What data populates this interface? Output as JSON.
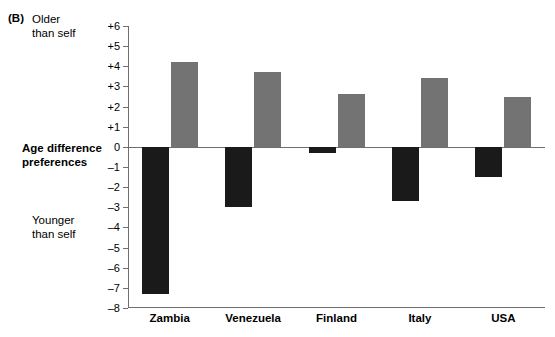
{
  "panel": {
    "letter": "(B)"
  },
  "annotations": {
    "older": "Older\nthan self",
    "older_line1": "Older",
    "older_line2": "than self",
    "younger_line1": "Younger",
    "younger_line2": "than self",
    "axis_title_line1": "Age difference",
    "axis_title_line2": "preferences"
  },
  "colors": {
    "negative_bar": "#1a1a1a",
    "positive_bar": "#737373",
    "axis": "#6e6e6e",
    "background": "#ffffff"
  },
  "chart_data": {
    "type": "bar",
    "title": "",
    "xlabel": "",
    "ylabel": "Age difference preferences",
    "categories": [
      "Zambia",
      "Venezuela",
      "Finland",
      "Italy",
      "USA"
    ],
    "series": [
      {
        "name": "Younger than self",
        "color": "#1a1a1a",
        "values": [
          -7.3,
          -3.0,
          -0.3,
          -2.7,
          -1.5
        ]
      },
      {
        "name": "Older than self",
        "color": "#737373",
        "values": [
          4.2,
          3.7,
          2.6,
          3.4,
          2.5
        ]
      }
    ],
    "ylim": [
      -8,
      6
    ],
    "ytick_values": [
      6,
      5,
      4,
      3,
      2,
      1,
      0,
      -1,
      -2,
      -3,
      -4,
      -5,
      -6,
      -7,
      -8
    ],
    "ytick_labels": [
      "+6",
      "+5",
      "+4",
      "+3",
      "+2",
      "+1",
      "0",
      "–1",
      "–2",
      "–3",
      "–4",
      "–5",
      "–6",
      "–7",
      "–8"
    ],
    "grid": false,
    "legend": "none",
    "zero_reference_line": true,
    "axis_note_top": "Older than self",
    "axis_note_bottom": "Younger than self"
  }
}
